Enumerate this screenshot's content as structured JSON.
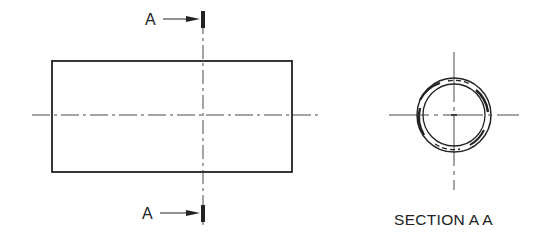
{
  "drawing": {
    "cutting_plane_label_top": "A",
    "cutting_plane_label_bottom": "A",
    "section_title": "SECTION A A"
  },
  "colors": {
    "line": "#222222",
    "background": "#ffffff"
  }
}
